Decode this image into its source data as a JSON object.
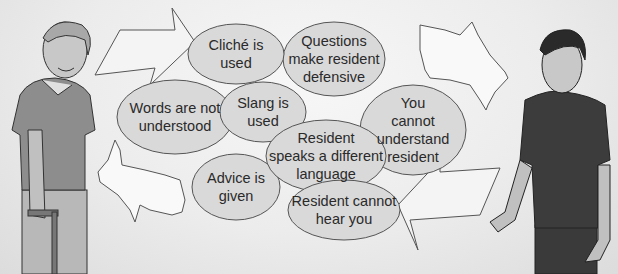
{
  "diagram": {
    "colors": {
      "bubble_fill": "#d9d9d9",
      "bubble_stroke": "#555555",
      "background": "#ececec",
      "arrow_fill": "#f4f4f4",
      "figure_shirt_left": "#8d8d8d",
      "figure_shirt_right": "#3c3c3c"
    },
    "figures": [
      {
        "id": "resident",
        "label": "Elderly resident with cane"
      },
      {
        "id": "caregiver",
        "label": "Caregiver"
      }
    ],
    "arrows": [
      {
        "id": "arrow-left",
        "direction": "right"
      },
      {
        "id": "arrow-right",
        "direction": "left"
      }
    ],
    "bubbles": [
      {
        "id": "cliche",
        "text": "Cliché is\nused"
      },
      {
        "id": "questions",
        "text": "Questions\nmake resident\ndefensive"
      },
      {
        "id": "words",
        "text": "Words are not\nunderstood"
      },
      {
        "id": "slang",
        "text": "Slang is\nused"
      },
      {
        "id": "cannot-understand",
        "text": "You\ncannot\nunderstand\nresident"
      },
      {
        "id": "language",
        "text": "Resident\nspeaks a different\nlanguage"
      },
      {
        "id": "advice",
        "text": "Advice is\ngiven"
      },
      {
        "id": "cannot-hear",
        "text": "Resident cannot\nhear you"
      }
    ]
  }
}
